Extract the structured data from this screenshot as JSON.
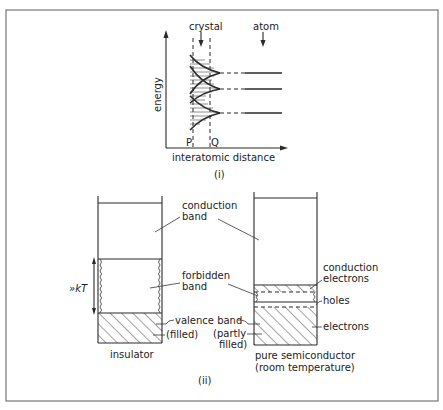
{
  "figure": {
    "part_i": {
      "caption": "(i)",
      "y_axis_label": "energy",
      "x_axis_label": "interatomic distance",
      "top_labels": {
        "crystal": "crystal",
        "atom": "atom"
      },
      "markers": {
        "p": "P",
        "q": "Q"
      }
    },
    "part_ii": {
      "caption": "(ii)",
      "insulator": {
        "title": "insulator",
        "gap_label": "»kT"
      },
      "semiconductor": {
        "title_line1": "pure semiconductor",
        "title_line2": "(room temperature)"
      },
      "center_labels": {
        "conduction_band_1": "conduction",
        "conduction_band_2": "band",
        "forbidden_band_1": "forbidden",
        "forbidden_band_2": "band",
        "valence_band": "valence band",
        "filled": "(filled)",
        "partly_1": "(partly",
        "partly_2": "filled)"
      },
      "right_labels": {
        "conduction_electrons_1": "conduction",
        "conduction_electrons_2": "electrons",
        "holes": "holes",
        "electrons": "electrons"
      }
    }
  }
}
